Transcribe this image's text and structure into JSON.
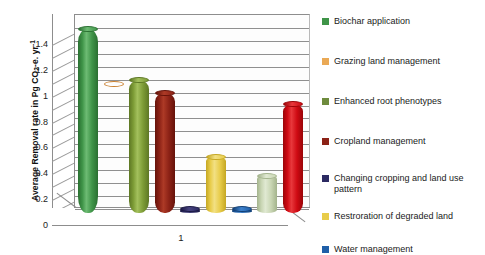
{
  "chart_data": {
    "type": "bar",
    "title": "",
    "xlabel": "1",
    "ylabel": "Average Removal rate in Pg CO2-e. yr-1",
    "ylabel_parts": {
      "pre": "Average Removal rate in Pg CO",
      "sub": "2",
      "mid": "-e. yr",
      "sup": "-1"
    },
    "categories": [
      "1"
    ],
    "ylim": [
      0,
      1.5
    ],
    "yticks": [
      0,
      0.2,
      0.4,
      0.6,
      0.8,
      1,
      1.2,
      1.4
    ],
    "ytick_labels": [
      "0",
      "0.2",
      "0.4",
      "0.6",
      "0.8",
      "1",
      "1.2",
      "1.4"
    ],
    "grid": true,
    "grid_minor": true,
    "legend_position": "right",
    "style": "3d-cylinder",
    "series": [
      {
        "name": "Biochar application",
        "value": 1.42,
        "color": "#3f9448"
      },
      {
        "name": "Grazing land management",
        "value": 1.0,
        "color": "#e9aköz"
      },
      {
        "name": "Enhanced root phenotypes",
        "value": 1.03,
        "color": "#7d9c36"
      },
      {
        "name": "Cropland management",
        "value": 0.93,
        "color": "#8c2216"
      },
      {
        "name": "Changing cropping and land use pattern",
        "value": 0.03,
        "color": "#2c2a62"
      },
      {
        "name": "Restroration of degraded land",
        "value": 0.43,
        "color": "#e8cc4a"
      },
      {
        "name": "Water management",
        "value": 0.03,
        "color": "#1f5fa8"
      },
      {
        "name": "Enhanced root phenotypes",
        "value": 0.29,
        "color": "#c9d6b4"
      },
      {
        "name": "Cropland management",
        "value": 0.84,
        "color": "#cf0a13"
      }
    ],
    "bars": [
      {
        "label": "Biochar application",
        "value": 1.42,
        "color": "#3f9448",
        "light": "#6dbb73",
        "dark": "#2a6f31"
      },
      {
        "label": "Grazing land management",
        "value": 1.0,
        "color": "#e9a košice",
        "light": "#f3c38a",
        "dark": "#c97f2f"
      },
      {
        "label": "Enhanced root phenotypes",
        "value": 1.03,
        "color": "#7d9c36",
        "light": "#a3c05c",
        "dark": "#5d7724"
      },
      {
        "label": "Cropland management",
        "value": 0.93,
        "color": "#8c2216",
        "light": "#ad3a26",
        "dark": "#651209"
      },
      {
        "label": "Changing cropping and land use pattern",
        "value": 0.03,
        "color": "#2c2a62",
        "light": "#46437f",
        "dark": "#1b1944"
      },
      {
        "label": "Restroration of degraded land",
        "value": 0.43,
        "color": "#e8cc4a",
        "light": "#f2e083",
        "dark": "#c5a722"
      },
      {
        "label": "Water management",
        "value": 0.03,
        "color": "#1f5fa8",
        "light": "#3d81cc",
        "dark": "#123f74"
      },
      {
        "label": "Enhanced root phenotypes (2)",
        "value": 0.29,
        "color": "#c9d6b4",
        "light": "#e0e9d2",
        "dark": "#a3b38c"
      },
      {
        "label": "Cropland management (2)",
        "value": 0.84,
        "color": "#cf0a13",
        "light": "#e8383c",
        "dark": "#9a0408"
      }
    ]
  },
  "legend": {
    "items": [
      {
        "label": "Biochar application",
        "color": "#3f9448"
      },
      {
        "label": "Grazing land management",
        "color": "#eaa955"
      },
      {
        "label": "Enhanced root phenotypes",
        "color": "#6e8b3d"
      },
      {
        "label": "Cropland management",
        "color": "#8c2216"
      },
      {
        "label": "Changing cropping and land use pattern",
        "color": "#2c2a62"
      },
      {
        "label": "Restroration of degraded land",
        "color": "#e8cc4a"
      },
      {
        "label": "Water management",
        "color": "#1f5fa8"
      }
    ]
  }
}
